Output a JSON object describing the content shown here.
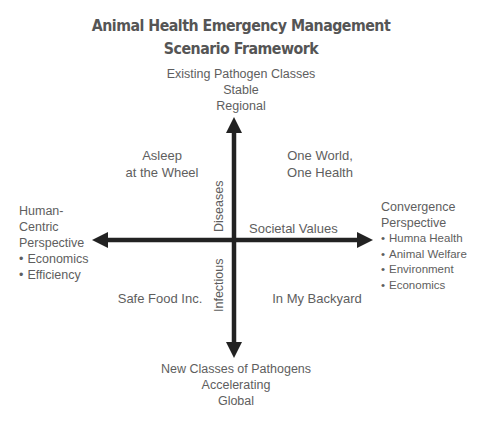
{
  "title": {
    "line1": "Animal Health Emergency Management",
    "line2": "Scenario Framework"
  },
  "axes": {
    "top": [
      "Existing Pathogen Classes",
      "Stable",
      "Regional"
    ],
    "bottom": [
      "New Classes of Pathogens",
      "Accelerating",
      "Global"
    ],
    "left": {
      "heading": [
        "Human-",
        "Centric",
        "Perspective"
      ],
      "bullets": [
        "Economics",
        "Efficiency"
      ]
    },
    "right": {
      "heading": [
        "Convergence",
        "Perspective"
      ],
      "bullets": [
        "Humna Health",
        "Animal Welfare",
        "Environment",
        "Economics"
      ]
    },
    "vertical_label_upper": "Diseases",
    "vertical_label_lower": "Infectious",
    "horizontal_label": "Societal Values"
  },
  "quadrants": {
    "top_left": [
      "Asleep",
      "at the Wheel"
    ],
    "top_right": [
      "One World,",
      "One Health"
    ],
    "bottom_left": [
      "Safe Food Inc."
    ],
    "bottom_right": [
      "In My Backyard"
    ]
  },
  "colors": {
    "arrow": "#222222",
    "text": "#5e5e5e",
    "title": "#555555"
  }
}
